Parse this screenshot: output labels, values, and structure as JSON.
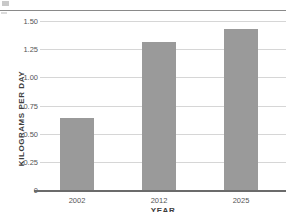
{
  "chart_data": {
    "type": "bar",
    "title": "",
    "xlabel": "YEAR",
    "ylabel": "KILOGRAMS PER DAY",
    "categories": [
      "2002",
      "2012",
      "2025"
    ],
    "values": [
      0.64,
      1.31,
      1.43
    ],
    "ylim": [
      0,
      1.5625
    ],
    "yticks": [
      0,
      0.25,
      0.5,
      0.75,
      1.0,
      1.25,
      1.5
    ],
    "ytick_labels": [
      "0",
      "0.25",
      "0.50",
      "0.75",
      "1.00",
      "1.25",
      "1.50"
    ],
    "grid": true,
    "legend": false,
    "bar_color": "#9a9a9a",
    "gridline_color": "#d6d6d6",
    "axis_color": "#6b6b6b",
    "series": [
      {
        "name": "Kilograms per day",
        "values": [
          0.64,
          1.31,
          1.43
        ]
      }
    ]
  },
  "axes": {
    "y_title": "KILOGRAMS PER DAY",
    "x_title": "YEAR"
  },
  "ticks": {
    "y": [
      {
        "label": "1.50",
        "value": 1.5
      },
      {
        "label": "1.25",
        "value": 1.25
      },
      {
        "label": "1.00",
        "value": 1.0
      },
      {
        "label": "0.75",
        "value": 0.75
      },
      {
        "label": "0.50",
        "value": 0.5
      },
      {
        "label": "0.25",
        "value": 0.25
      },
      {
        "label": "0",
        "value": 0
      }
    ],
    "x": [
      {
        "label": "2002"
      },
      {
        "label": "2012"
      },
      {
        "label": "2025"
      }
    ]
  }
}
